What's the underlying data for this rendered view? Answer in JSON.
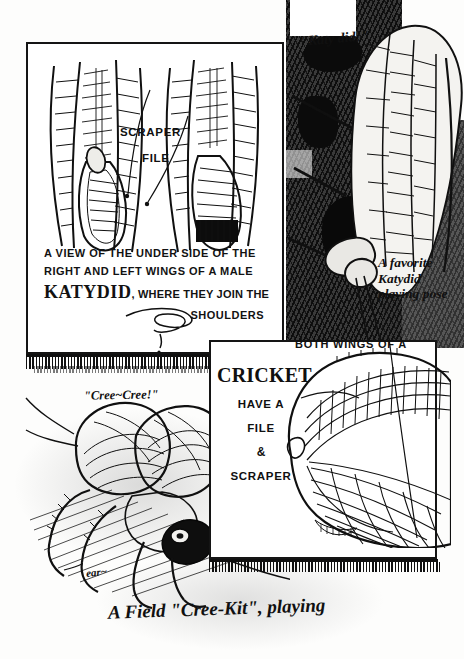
{
  "plate": {
    "title": "A View of the Under Side of the Right and Left Wings of a Male Katydid",
    "background_color": "#fdfdfc",
    "ink_color": "#101010",
    "width": 464,
    "height": 659
  },
  "panel_katydid_wings": {
    "name": "Katydid wing bases",
    "labels": {
      "scraper": "SCRAPER",
      "file": "FILE"
    },
    "caption": {
      "line1": "A VIEW OF THE UNDER SIDE OF THE",
      "line2": "RIGHT AND LEFT WINGS OF A MALE",
      "line3_word": "KATYDID",
      "line3_rest": ", WHERE THEY JOIN THE",
      "line4": "SHOULDERS"
    },
    "flourish": "pen-flourish-squiggle"
  },
  "panel_katydid_photo": {
    "sound_bubble": "\"Katy did!\"",
    "pose_note": "A favorite Katydid playing pose"
  },
  "panel_cricket_wing": {
    "heading_small": "BOTH WINGS OF A",
    "heading_large": "CRICKET",
    "list": [
      "HAVE A",
      "FILE",
      "&",
      "SCRAPER"
    ]
  },
  "panel_cricket_photo": {
    "sound_bubble": "\"Cree~Cree!\"",
    "ear_label": "ear~",
    "bottom_caption": "A Field \"Cree-Kit\", playing"
  },
  "icons": {
    "leader_line": "pointer-line-icon",
    "flourish": "flourish-icon",
    "comb_rule": "comb-rule-icon"
  }
}
